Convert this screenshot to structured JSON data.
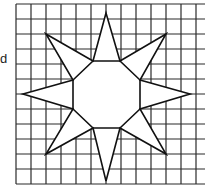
{
  "figure": {
    "side_label": "d",
    "colors": {
      "grid": "#2a2a2a",
      "outline": "#111111",
      "fill": "#ffffff",
      "background": "#ffffff"
    },
    "grid": {
      "x0": 16,
      "y0": 4,
      "spacing": 15,
      "cols": 13,
      "rows": 13,
      "x_end": 205,
      "y_end": 184
    },
    "star": {
      "points": [
        [
          106,
          13
        ],
        [
          120,
          61
        ],
        [
          166,
          34
        ],
        [
          140,
          80
        ],
        [
          190,
          94
        ],
        [
          140,
          109
        ],
        [
          166,
          154
        ],
        [
          120,
          128
        ],
        [
          106,
          181
        ],
        [
          93,
          128
        ],
        [
          46,
          154
        ],
        [
          73,
          109
        ],
        [
          23,
          94
        ],
        [
          73,
          80
        ],
        [
          46,
          34
        ],
        [
          93,
          61
        ]
      ],
      "octagon": [
        [
          93,
          61
        ],
        [
          120,
          61
        ],
        [
          140,
          80
        ],
        [
          140,
          109
        ],
        [
          120,
          128
        ],
        [
          93,
          128
        ],
        [
          73,
          109
        ],
        [
          73,
          80
        ]
      ]
    }
  }
}
